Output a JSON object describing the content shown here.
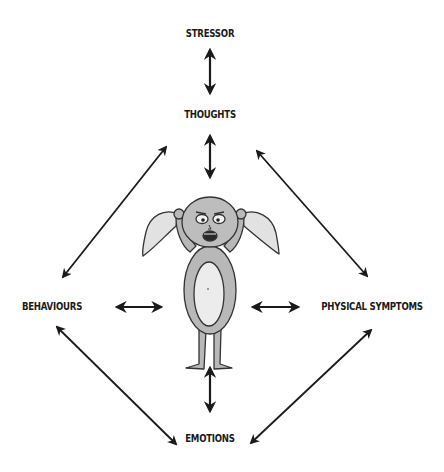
{
  "diagram": {
    "type": "cycle-diagram",
    "nodes": {
      "stressor": "STRESSOR",
      "thoughts": "THOUGHTS",
      "behaviours": "BEHAVIOURS",
      "physical_symptoms": "PHYSICAL SYMPTOMS",
      "emotions": "EMOTIONS"
    },
    "center_figure": "anxious-creature-holding-ears",
    "edges": [
      {
        "from": "stressor",
        "to": "thoughts",
        "style": "double-arrow"
      },
      {
        "from": "thoughts",
        "to": "center_figure",
        "style": "double-arrow"
      },
      {
        "from": "behaviours",
        "to": "center_figure",
        "style": "double-arrow"
      },
      {
        "from": "physical_symptoms",
        "to": "center_figure",
        "style": "double-arrow"
      },
      {
        "from": "emotions",
        "to": "center_figure",
        "style": "double-arrow"
      },
      {
        "from": "thoughts",
        "to": "behaviours",
        "style": "double-arrow"
      },
      {
        "from": "thoughts",
        "to": "physical_symptoms",
        "style": "double-arrow"
      },
      {
        "from": "behaviours",
        "to": "emotions",
        "style": "double-arrow"
      },
      {
        "from": "physical_symptoms",
        "to": "emotions",
        "style": "double-arrow"
      }
    ],
    "colors": {
      "ink": "#1a1a1a",
      "figure_body": "#b8b8b8",
      "figure_belly": "#ececec",
      "background": "#ffffff"
    }
  }
}
